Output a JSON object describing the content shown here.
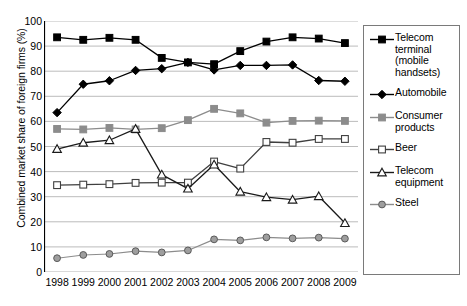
{
  "chart_data": {
    "type": "line",
    "title": "",
    "xlabel": "",
    "ylabel": "Combined market share of foreign firms (%)",
    "categories": [
      "1998",
      "1999",
      "2000",
      "2001",
      "2002",
      "2003",
      "2004",
      "2005",
      "2006",
      "2007",
      "2008",
      "2009"
    ],
    "ylim": [
      0,
      100
    ],
    "ytick_step": 10,
    "yticks": [
      "100",
      "90",
      "80",
      "70",
      "60",
      "50",
      "40",
      "30",
      "20",
      "10",
      "0"
    ],
    "grid": "horizontal",
    "legend_position": "right",
    "series": [
      {
        "name": "Telecom terminal (mobile handsets)",
        "marker": "filled-square",
        "color": "#000000",
        "values": [
          93.5,
          92.5,
          93.3,
          92.5,
          85.3,
          83.5,
          82.8,
          88.0,
          91.8,
          93.5,
          93.0,
          91.2
        ]
      },
      {
        "name": "Automobile",
        "marker": "filled-diamond",
        "color": "#000000",
        "values": [
          63.5,
          74.8,
          76.2,
          80.3,
          81.0,
          83.5,
          80.5,
          82.3,
          82.3,
          82.5,
          76.3,
          76.0
        ]
      },
      {
        "name": "Consumer products",
        "marker": "filled-square",
        "color": "#8c8c8c",
        "values": [
          57.0,
          56.8,
          57.4,
          56.8,
          57.3,
          60.5,
          65.0,
          63.2,
          59.5,
          60.2,
          60.3,
          60.2
        ]
      },
      {
        "name": "Beer",
        "marker": "open-square",
        "color": "#3f3f3f",
        "values": [
          34.6,
          34.8,
          35.0,
          35.5,
          35.6,
          35.6,
          44.0,
          41.2,
          51.8,
          51.5,
          53.0,
          53.0
        ]
      },
      {
        "name": "Telecom equipment",
        "marker": "open-triangle",
        "color": "#1a1a1a",
        "values": [
          49.0,
          51.5,
          52.5,
          57.0,
          38.8,
          33.2,
          42.8,
          32.0,
          29.8,
          28.8,
          30.2,
          19.5
        ]
      },
      {
        "name": "Steel",
        "marker": "filled-circle",
        "color": "#8c8c8c",
        "values": [
          5.5,
          6.8,
          7.2,
          8.3,
          7.8,
          8.6,
          13.0,
          12.6,
          13.8,
          13.4,
          13.7,
          13.3
        ]
      }
    ]
  }
}
